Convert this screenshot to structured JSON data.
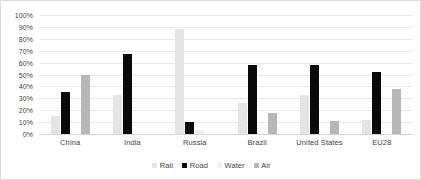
{
  "chart_data": {
    "type": "bar",
    "title": "",
    "subtitle": "",
    "xlabel": "",
    "ylabel": "",
    "ylim": [
      0,
      100
    ],
    "grid": true,
    "legend_position": "bottom",
    "categories": [
      "China",
      "India",
      "Russia",
      "Brazil",
      "United States",
      "EU28"
    ],
    "series": [
      {
        "name": "Rail",
        "color": "#e4e4e4",
        "values": [
          15,
          33,
          88,
          26,
          33,
          12
        ]
      },
      {
        "name": "Road",
        "color": "#0a0a0a",
        "values": [
          35,
          67,
          10,
          58,
          58,
          52
        ]
      },
      {
        "name": "Water",
        "color": "#f0f0f0",
        "values": [
          0,
          0,
          3.5,
          0,
          0,
          0
        ]
      },
      {
        "name": "Air",
        "color": "#b7b7b7",
        "values": [
          50,
          0,
          0,
          18,
          11,
          38
        ]
      }
    ],
    "y_ticks": [
      "0%",
      "10%",
      "20%",
      "30%",
      "40%",
      "50%",
      "60%",
      "70%",
      "80%",
      "90%",
      "100%"
    ],
    "y_tick_values": [
      0,
      10,
      20,
      30,
      40,
      50,
      60,
      70,
      80,
      90,
      100
    ]
  },
  "colors": {
    "gridline": "#e9e9e9",
    "axis": "#d4d4d4",
    "border": "#dcdcdc",
    "text": "#3f3f3f",
    "background": "#ffffff"
  }
}
